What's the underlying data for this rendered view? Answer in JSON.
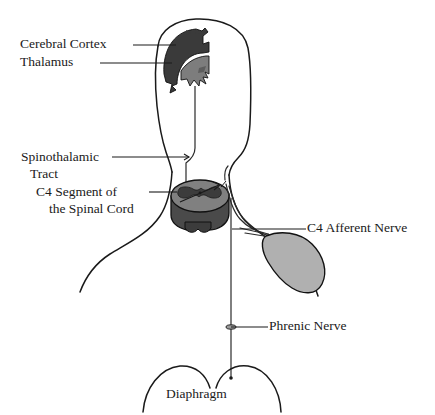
{
  "figure": {
    "background_color": "#ffffff",
    "line_color": "#1a1a1a"
  },
  "colors": {
    "cerebral_cortex": "#3a3a3a",
    "thalamus": "#7d7d7d",
    "spinal_cord_white_matter": "#808080",
    "spinal_cord_gray_matter": "#3c3c3c",
    "spinal_cord_side": "#4a4a4a",
    "organ": "#b0b0b0",
    "outline": "#1a1a1a",
    "text": "#111111"
  },
  "labels": {
    "cerebral_cortex": "Cerebral Cortex",
    "thalamus": "Thalamus",
    "spinothalamic_tract_line1": "Spinothalamic",
    "spinothalamic_tract_line2": "Tract",
    "c4_segment_line1": "C4 Segment of",
    "c4_segment_line2": "the Spinal Cord",
    "c4_afferent_nerve": "C4 Afferent Nerve",
    "phrenic_nerve": "Phrenic Nerve",
    "diaphragm": "Diaphragm"
  },
  "structures": [
    {
      "name": "cerebral-cortex",
      "type": "brain-region",
      "fill": "#3a3a3a"
    },
    {
      "name": "thalamus",
      "type": "brain-region",
      "fill": "#7d7d7d"
    },
    {
      "name": "spinothalamic-tract",
      "type": "nerve-pathway"
    },
    {
      "name": "c4-spinal-cord-segment",
      "type": "spinal-cord-cross-section"
    },
    {
      "name": "c4-afferent-nerve",
      "type": "nerve-pathway"
    },
    {
      "name": "phrenic-nerve",
      "type": "nerve-pathway"
    },
    {
      "name": "diaphragm",
      "type": "muscle"
    },
    {
      "name": "referred-organ",
      "type": "organ",
      "fill": "#b0b0b0"
    }
  ]
}
